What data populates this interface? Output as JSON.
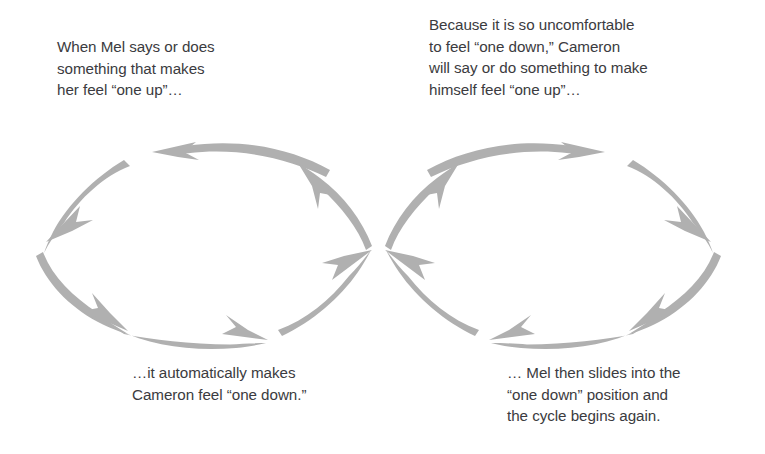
{
  "diagram": {
    "type": "figure-eight-cycle",
    "background_color": "#ffffff",
    "arrow_color": "#b0b0b0",
    "text_color": "#3b3b40",
    "loops": [
      {
        "id": "left-loop",
        "name": "Mel one-up / Cameron one-down loop",
        "direction": "counter-clockwise",
        "center_x": 197,
        "center_y": 246,
        "radius_x": 180,
        "radius_y": 108,
        "arrow_count": 4
      },
      {
        "id": "right-loop",
        "name": "Cameron one-up / Mel one-down loop",
        "direction": "clockwise",
        "center_x": 560,
        "center_y": 246,
        "radius_x": 180,
        "radius_y": 108,
        "arrow_count": 4
      }
    ],
    "crossing_point": {
      "x": 378,
      "y": 248
    }
  },
  "captions": {
    "top_left": "When Mel says or does\nsomething that makes\nher feel “one up”…",
    "top_right": "Because it is so uncomfortable\nto feel “one down,” Cameron\nwill say or do something to make\nhimself feel “one up”…",
    "bottom_left": "…it automatically makes\nCameron feel “one down.”",
    "bottom_right": "… Mel then slides into the\n“one down” position and\nthe cycle begins again."
  }
}
